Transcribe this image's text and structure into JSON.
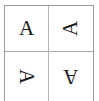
{
  "figure": {
    "name": "letter-rotation-grid",
    "background_color": "#ffffff",
    "border_color": "#9a9a9a",
    "divider_color": "#b4b4b4",
    "glyph_color": "#1c1c1c",
    "rows": 2,
    "columns": 2
  },
  "cells": [
    {
      "position": "top-left",
      "letter": "A",
      "rotation_degrees": "0",
      "rotation_label": "upright"
    },
    {
      "position": "top-right",
      "letter": "A",
      "rotation_degrees": "-90",
      "rotation_label": "rotated 90 degrees counter-clockwise"
    },
    {
      "position": "bottom-left",
      "letter": "A",
      "rotation_degrees": "90",
      "rotation_label": "rotated 90 degrees clockwise"
    },
    {
      "position": "bottom-right",
      "letter": "A",
      "rotation_degrees": "180",
      "rotation_label": "rotated 180 degrees"
    }
  ]
}
